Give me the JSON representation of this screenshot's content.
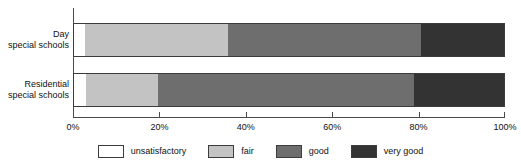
{
  "chart_data": {
    "type": "bar",
    "orientation": "horizontal",
    "stacked": true,
    "normalized_percent": true,
    "title": "",
    "subtitle": "",
    "xlabel": "",
    "ylabel": "",
    "xlim": [
      0,
      100
    ],
    "xticks": [
      0,
      20,
      40,
      60,
      80,
      100
    ],
    "xticklabels": [
      "0%",
      "20%",
      "40%",
      "60%",
      "80%",
      "100%"
    ],
    "grid": false,
    "legend_position": "bottom",
    "categories": [
      {
        "line1": "Day",
        "line2": "special schools"
      },
      {
        "line1": "Residential",
        "line2": "special schools"
      }
    ],
    "category_labels": [
      "Day special schools",
      "Residential special schools"
    ],
    "series": [
      {
        "name": "unsatisfactory",
        "color": "#ffffff",
        "values": [
          2.8,
          3.0
        ]
      },
      {
        "name": "fair",
        "color": "#c3c3c3",
        "values": [
          33.1,
          16.7
        ]
      },
      {
        "name": "good",
        "color": "#6e6e6e",
        "values": [
          44.7,
          59.2
        ]
      },
      {
        "name": "very good",
        "color": "#333333",
        "values": [
          19.4,
          21.1
        ]
      }
    ],
    "legend": [
      {
        "label": "unsatisfactory",
        "color": "#ffffff"
      },
      {
        "label": "fair",
        "color": "#c3c3c3"
      },
      {
        "label": "good",
        "color": "#6e6e6e"
      },
      {
        "label": "very good",
        "color": "#333333"
      }
    ],
    "axis_color": "#4a4a4a",
    "bar_border_color": "#3c3c3c",
    "text_color": "#111111",
    "background": "#ffffff"
  }
}
